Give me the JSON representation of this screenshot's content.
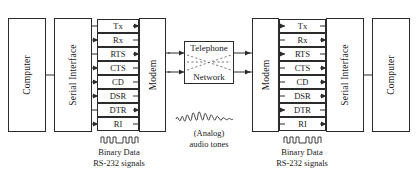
{
  "diagram": {
    "boxes": {
      "computer_left": "Computer",
      "serial_left": "Serial Interface",
      "modem_left": "Modem",
      "modem_right": "Modem",
      "serial_right": "Serial Interface",
      "computer_right": "Computer"
    },
    "network": {
      "line1": "Telephone",
      "line2": "Network"
    },
    "signals_left": [
      {
        "name": "Tx",
        "direction": "right"
      },
      {
        "name": "Rx",
        "direction": "left"
      },
      {
        "name": "RTS",
        "direction": "right"
      },
      {
        "name": "CTS",
        "direction": "left"
      },
      {
        "name": "CD",
        "direction": "left"
      },
      {
        "name": "DSR",
        "direction": "left"
      },
      {
        "name": "DTR",
        "direction": "right"
      },
      {
        "name": "RI",
        "direction": "left"
      }
    ],
    "signals_right": [
      {
        "name": "Tx",
        "direction": "left"
      },
      {
        "name": "Rx",
        "direction": "right"
      },
      {
        "name": "RTS",
        "direction": "left"
      },
      {
        "name": "CTS",
        "direction": "right"
      },
      {
        "name": "CD",
        "direction": "right"
      },
      {
        "name": "DSR",
        "direction": "right"
      },
      {
        "name": "DTR",
        "direction": "left"
      },
      {
        "name": "RI",
        "direction": "right"
      }
    ],
    "captions": {
      "binary_left_line1": "Binary Data",
      "binary_left_line2": "RS-232 signals",
      "binary_right_line1": "Binary Data",
      "binary_right_line2": "RS-232 signals",
      "analog_line1": "(Analog)",
      "analog_line2": "audio tones"
    },
    "colors": {
      "stroke": "#2b2b2b",
      "dashed": "#5a5a5a",
      "background": "#ffffff",
      "text": "#1a1a1a"
    }
  }
}
